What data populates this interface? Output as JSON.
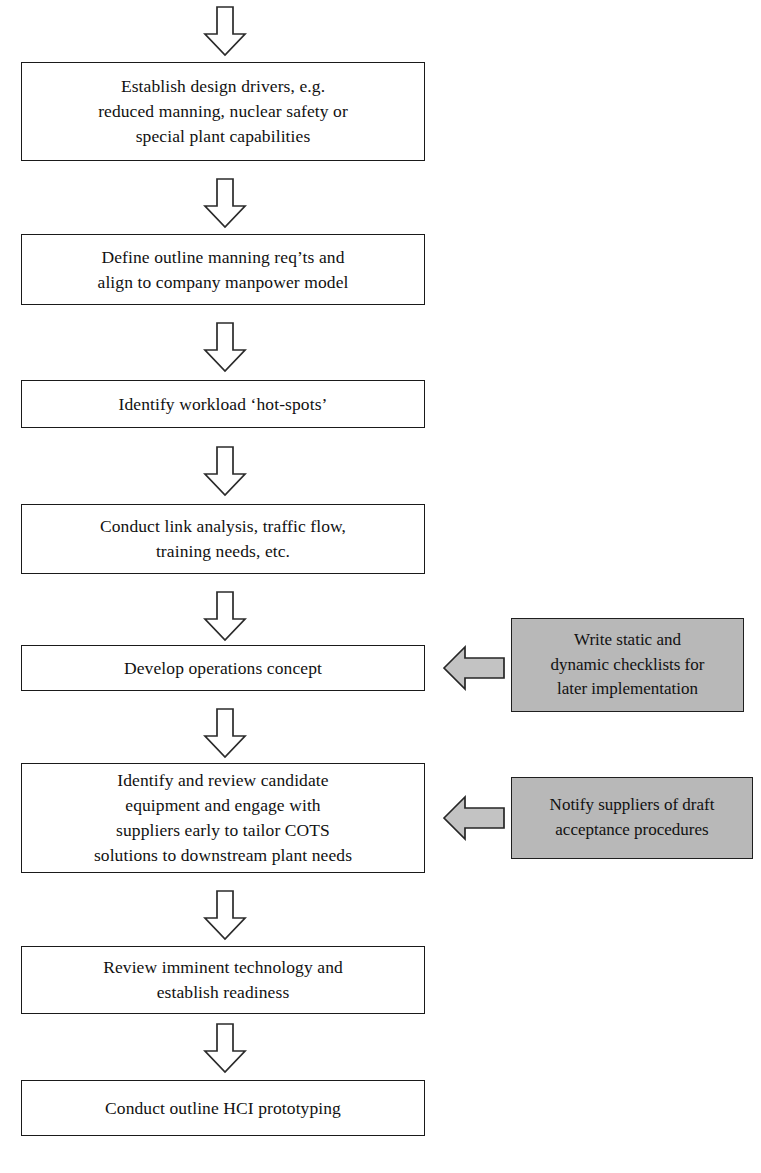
{
  "diagram": {
    "background_color": "#ffffff",
    "line_color": "#1a1a1a",
    "note_fill_color": "#b8b8b8",
    "arrow_fill_color": "#ffffff",
    "note_arrow_fill_color": "#c3c3c3"
  },
  "nodes": [
    {
      "id": "establish-design-drivers",
      "text": "Establish design drivers, e.g.\nreduced manning, nuclear safety or\nspecial plant capabilities"
    },
    {
      "id": "define-outline-manning",
      "text": "Define outline manning req’ts and\nalign to company manpower model"
    },
    {
      "id": "identify-workload-hotspots",
      "text": "Identify workload ‘hot-spots’"
    },
    {
      "id": "conduct-link-analysis",
      "text": "Conduct link analysis, traffic flow,\ntraining needs, etc."
    },
    {
      "id": "develop-operations-concept",
      "text": "Develop operations concept"
    },
    {
      "id": "identify-review-candidate-equipment",
      "text": "Identify and review candidate\nequipment and engage with\nsuppliers early to tailor COTS\nsolutions to downstream plant needs"
    },
    {
      "id": "review-imminent-technology",
      "text": "Review imminent technology and\nestablish readiness"
    },
    {
      "id": "conduct-outline-hci-prototyping",
      "text": "Conduct outline HCI prototyping"
    }
  ],
  "notes": [
    {
      "id": "write-checklists",
      "text": "Write static and\ndynamic checklists for\nlater implementation",
      "target": "develop-operations-concept"
    },
    {
      "id": "notify-suppliers",
      "text": "Notify suppliers of draft\nacceptance procedures",
      "target": "identify-review-candidate-equipment"
    }
  ],
  "connectors": {
    "down_arrow_count": 8,
    "left_arrow_count": 2,
    "style": "hollow-block-arrow"
  },
  "caption": {
    "text": ""
  }
}
